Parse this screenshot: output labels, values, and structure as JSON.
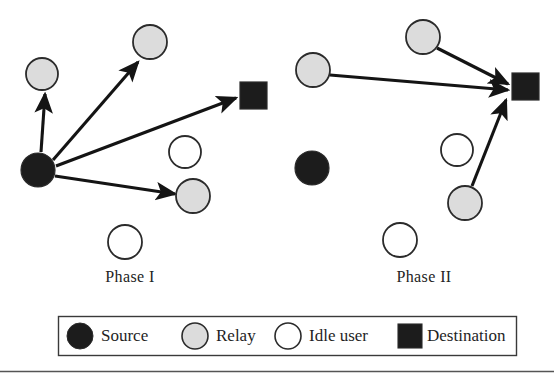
{
  "figure": {
    "panels": [
      {
        "id": "phase-one",
        "caption": "Phase I"
      },
      {
        "id": "phase-two",
        "caption": "Phase II"
      }
    ]
  },
  "colors": {
    "source_fill": "#1c1c1c",
    "relay_fill": "#dcdcdc",
    "idle_fill": "#ffffff",
    "destination_fill": "#1c1c1c",
    "node_stroke": "#2b2b2b",
    "arrow": "#141414",
    "legend_border": "#3a3a3a",
    "rule": "#555555",
    "background": "#ffffff"
  },
  "phase_one": {
    "caption": "Phase I",
    "nodes": [
      {
        "name": "source",
        "type": "source",
        "shape": "circle",
        "cx": 38,
        "cy": 170,
        "r": 17
      },
      {
        "name": "relay-upper-left",
        "type": "relay",
        "shape": "circle",
        "cx": 42,
        "cy": 74,
        "r": 16
      },
      {
        "name": "relay-top",
        "type": "relay",
        "shape": "circle",
        "cx": 150,
        "cy": 42,
        "r": 17
      },
      {
        "name": "relay-lower-right",
        "type": "relay",
        "shape": "circle",
        "cx": 193,
        "cy": 196,
        "r": 17
      },
      {
        "name": "idle-user-middle",
        "type": "idle",
        "shape": "circle",
        "cx": 185,
        "cy": 152,
        "r": 16
      },
      {
        "name": "idle-user-bottom",
        "type": "idle",
        "shape": "circle",
        "cx": 125,
        "cy": 242,
        "r": 17
      },
      {
        "name": "destination",
        "type": "destination",
        "shape": "square",
        "x": 240,
        "y": 82,
        "size": 27
      }
    ],
    "arrows": [
      {
        "name": "source-to-relay-upper-left",
        "x1": 41,
        "y1": 152,
        "x2": 45,
        "y2": 94
      },
      {
        "name": "source-to-relay-top",
        "x1": 53,
        "y1": 160,
        "x2": 138,
        "y2": 62
      },
      {
        "name": "source-to-destination",
        "x1": 56,
        "y1": 166,
        "x2": 236,
        "y2": 98
      },
      {
        "name": "source-to-relay-lower-right",
        "x1": 55,
        "y1": 176,
        "x2": 175,
        "y2": 194
      }
    ]
  },
  "phase_two": {
    "caption": "Phase II",
    "nodes": [
      {
        "name": "source",
        "type": "source",
        "shape": "circle",
        "cx": 312,
        "cy": 168,
        "r": 17
      },
      {
        "name": "relay-left",
        "type": "relay",
        "shape": "circle",
        "cx": 313,
        "cy": 70,
        "r": 17
      },
      {
        "name": "relay-top",
        "type": "relay",
        "shape": "circle",
        "cx": 423,
        "cy": 37,
        "r": 17
      },
      {
        "name": "relay-lower-right",
        "type": "relay",
        "shape": "circle",
        "cx": 465,
        "cy": 203,
        "r": 17
      },
      {
        "name": "idle-user-middle",
        "type": "idle",
        "shape": "circle",
        "cx": 457,
        "cy": 150,
        "r": 16
      },
      {
        "name": "idle-user-bottom",
        "type": "idle",
        "shape": "circle",
        "cx": 400,
        "cy": 240,
        "r": 17
      },
      {
        "name": "destination",
        "type": "destination",
        "shape": "square",
        "x": 512,
        "y": 73,
        "size": 27
      }
    ],
    "arrows": [
      {
        "name": "relay-left-to-destination",
        "x1": 330,
        "y1": 75,
        "x2": 508,
        "y2": 90
      },
      {
        "name": "relay-top-to-destination",
        "x1": 437,
        "y1": 48,
        "x2": 508,
        "y2": 84
      },
      {
        "name": "relay-lower-right-to-destination",
        "x1": 472,
        "y1": 186,
        "x2": 506,
        "y2": 100
      }
    ]
  },
  "legend": {
    "box": {
      "x": 58,
      "y": 316,
      "width": 458,
      "height": 39
    },
    "items": [
      {
        "name": "source",
        "label": "Source",
        "symbol": "filled-circle",
        "cx": 80,
        "cy": 336,
        "r": 13,
        "label_x": 101,
        "label_y": 327
      },
      {
        "name": "relay",
        "label": "Relay",
        "symbol": "gray-circle",
        "cx": 195,
        "cy": 336,
        "r": 13,
        "label_x": 216,
        "label_y": 327
      },
      {
        "name": "idle-user",
        "label": "Idle user",
        "symbol": "white-circle",
        "cx": 288,
        "cy": 336,
        "r": 13,
        "label_x": 309,
        "label_y": 327
      },
      {
        "name": "destination",
        "label": "Destination",
        "symbol": "filled-square",
        "x": 398,
        "y": 324,
        "size": 24,
        "label_x": 427,
        "label_y": 327
      }
    ]
  },
  "footer_rule": {
    "y": 371,
    "x1": 0,
    "x2": 554
  }
}
